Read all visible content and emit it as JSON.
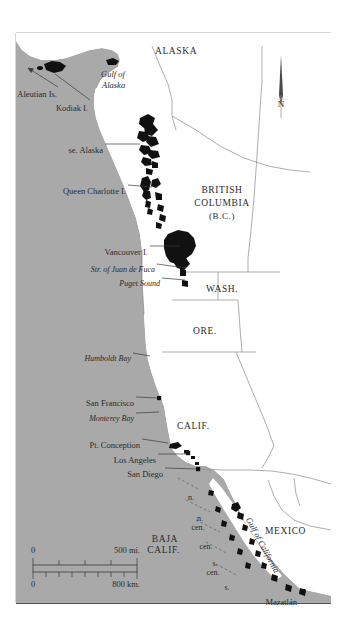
{
  "map": {
    "title": "Pacific coast range map",
    "colors": {
      "ocean": "#a9a9a9",
      "land": "#ffffff",
      "habitat": "#111111",
      "border": "#7a7a7a",
      "frame": "#808080",
      "frame_bottom": "#1a1a1a",
      "text": "#2a2a2a",
      "background": "#ffffff"
    },
    "frame": {
      "left": 16,
      "top": 33,
      "right": 331,
      "bottom": 603
    },
    "north_arrow": {
      "label": "N",
      "x": 281,
      "y": 55,
      "height": 50
    },
    "scale_bar": {
      "miles": {
        "zero": "0",
        "max": "500 mi."
      },
      "kilometers": {
        "zero": "0",
        "max": "800 km."
      },
      "x": 33,
      "y": 556,
      "width": 104
    },
    "regions": [
      {
        "name": "ALASKA",
        "style": "caps",
        "x": 155,
        "y": 47,
        "size": 9.5,
        "anchor": "left"
      },
      {
        "name": "BRITISH",
        "style": "caps",
        "x": 222,
        "y": 186,
        "size": 9.5,
        "anchor": "center"
      },
      {
        "name": "COLUMBIA",
        "style": "caps",
        "x": 222,
        "y": 199,
        "size": 9.5,
        "anchor": "center"
      },
      {
        "name": "(B.C.)",
        "style": "caps",
        "x": 222,
        "y": 212,
        "size": 9,
        "anchor": "center"
      },
      {
        "name": "WASH.",
        "style": "caps",
        "x": 206,
        "y": 285,
        "size": 9.5,
        "anchor": "left"
      },
      {
        "name": "ORE.",
        "style": "caps",
        "x": 193,
        "y": 327,
        "size": 9.5,
        "anchor": "left"
      },
      {
        "name": "CALIF.",
        "style": "caps",
        "x": 177,
        "y": 422,
        "size": 9.5,
        "anchor": "left"
      },
      {
        "name": "BAJA",
        "style": "caps",
        "x": 178,
        "y": 535,
        "size": 9.5,
        "anchor": "right"
      },
      {
        "name": "CALIF.",
        "style": "caps",
        "x": 180,
        "y": 546,
        "size": 9.5,
        "anchor": "right"
      },
      {
        "name": "MEXICO",
        "style": "caps",
        "x": 265,
        "y": 527,
        "size": 9.5,
        "anchor": "left"
      }
    ],
    "water_labels": [
      {
        "name": "Gulf of",
        "x": 101,
        "y": 70,
        "size": 8.5
      },
      {
        "name": "Alaska",
        "x": 102,
        "y": 81,
        "size": 8.5
      },
      {
        "name": "Gulf of California",
        "x": 252,
        "y": 516,
        "size": 8.5,
        "rotate": 62
      }
    ],
    "place_labels": [
      {
        "name": "Aleutian Is.",
        "x": 57,
        "y": 90,
        "size": 8.5,
        "italic": false,
        "anchor": "right",
        "leader": {
          "x1": 58,
          "y1": 87,
          "x2": 28,
          "y2": 68
        },
        "arrow": true
      },
      {
        "name": "Kodiak I.",
        "x": 88,
        "y": 104,
        "size": 8.5,
        "italic": false,
        "anchor": "right",
        "leader": {
          "x1": 90,
          "y1": 100,
          "x2": 55,
          "y2": 74
        }
      },
      {
        "name": "se. Alaska",
        "x": 103,
        "y": 146,
        "size": 8.5,
        "italic": false,
        "anchor": "right",
        "leader": {
          "x1": 105,
          "y1": 144,
          "x2": 140,
          "y2": 144
        }
      },
      {
        "name": "Queen Charlotte I.",
        "x": 126,
        "y": 187,
        "size": 8.5,
        "italic": false,
        "anchor": "right",
        "leader": {
          "x1": 128,
          "y1": 185,
          "x2": 152,
          "y2": 187
        }
      },
      {
        "name": "Vancouver I.",
        "x": 148,
        "y": 248,
        "size": 8.5,
        "italic": false,
        "anchor": "right",
        "leader": {
          "x1": 150,
          "y1": 246,
          "x2": 180,
          "y2": 246
        }
      },
      {
        "name": "Str. of Juan de Fuca",
        "x": 155,
        "y": 266,
        "size": 8,
        "italic": true,
        "anchor": "right",
        "leader": {
          "x1": 157,
          "y1": 264,
          "x2": 186,
          "y2": 268
        }
      },
      {
        "name": "Puget Sound",
        "x": 160,
        "y": 280,
        "size": 8,
        "italic": true,
        "anchor": "right",
        "leader": {
          "x1": 162,
          "y1": 278,
          "x2": 185,
          "y2": 280
        }
      },
      {
        "name": "Humboldt Bay",
        "x": 131,
        "y": 355,
        "size": 8,
        "italic": true,
        "anchor": "right",
        "leader": {
          "x1": 133,
          "y1": 353,
          "x2": 150,
          "y2": 356
        }
      },
      {
        "name": "San Francisco",
        "x": 134,
        "y": 399,
        "size": 8.5,
        "italic": false,
        "anchor": "right",
        "leader": {
          "x1": 136,
          "y1": 397,
          "x2": 158,
          "y2": 398
        },
        "dot": {
          "x": 159,
          "y": 398
        }
      },
      {
        "name": "Monterey Bay",
        "x": 134,
        "y": 415,
        "size": 8,
        "italic": true,
        "anchor": "right",
        "leader": {
          "x1": 136,
          "y1": 413,
          "x2": 159,
          "y2": 412
        }
      },
      {
        "name": "Pt. Conception",
        "x": 140,
        "y": 441,
        "size": 8.5,
        "italic": false,
        "anchor": "right",
        "leader": {
          "x1": 142,
          "y1": 439,
          "x2": 168,
          "y2": 443
        }
      },
      {
        "name": "Los Angeles",
        "x": 156,
        "y": 456,
        "size": 8.5,
        "italic": false,
        "anchor": "right",
        "leader": {
          "x1": 158,
          "y1": 454,
          "x2": 187,
          "y2": 454
        },
        "dot": {
          "x": 188,
          "y": 453
        }
      },
      {
        "name": "San Diego",
        "x": 163,
        "y": 470,
        "size": 8.5,
        "italic": false,
        "anchor": "right",
        "leader": {
          "x1": 165,
          "y1": 468,
          "x2": 197,
          "y2": 469
        },
        "dot": {
          "x": 198,
          "y": 469
        }
      },
      {
        "name": "Mazatlán",
        "x": 297,
        "y": 598,
        "size": 8.5,
        "italic": false,
        "anchor": "right",
        "dot": {
          "x": 303,
          "y": 591
        }
      }
    ],
    "baja_subdivisions": [
      {
        "name": "n.",
        "x": 191,
        "y": 494,
        "size": 8
      },
      {
        "name": "n.",
        "x": 200,
        "y": 515,
        "size": 8
      },
      {
        "name": "cen.",
        "x": 198,
        "y": 524,
        "size": 8
      },
      {
        "name": "cen.",
        "x": 206,
        "y": 543,
        "size": 8
      },
      {
        "name": "s.",
        "x": 215,
        "y": 560,
        "size": 8
      },
      {
        "name": "cen.",
        "x": 213,
        "y": 569,
        "size": 8
      },
      {
        "name": "s.",
        "x": 227,
        "y": 584,
        "size": 8
      }
    ]
  }
}
